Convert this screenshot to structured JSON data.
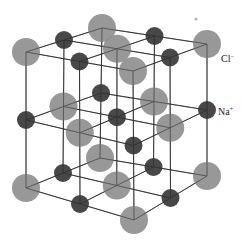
{
  "diagram": {
    "colors": {
      "cl": "#8f8f8f",
      "na": "#3e3e3e",
      "line": "#2a2a2a",
      "speck": "#b8b8b8"
    },
    "radii": {
      "cl": 14,
      "na": 9
    },
    "corners": {
      "top": {
        "FL": [
          26,
          52
        ],
        "FR": [
          133,
          71
        ],
        "BL": [
          102,
          28
        ],
        "BR": [
          207,
          44
        ]
      },
      "bottom": {
        "FL": [
          26,
          188
        ],
        "FR": [
          134,
          220
        ],
        "BL": [
          100,
          158
        ],
        "BR": [
          207,
          176
        ]
      }
    },
    "grid_size": 3,
    "corner_ion": "Cl",
    "labels": [
      {
        "ion": "Cl",
        "charge": "−",
        "x": 221,
        "y": 53
      },
      {
        "ion": "Na",
        "charge": "+",
        "x": 218,
        "y": 106
      }
    ],
    "speck": {
      "x": 196,
      "y": 19,
      "r": 1.6
    }
  }
}
